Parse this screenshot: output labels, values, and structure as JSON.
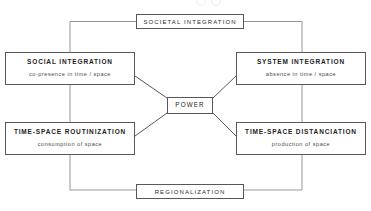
{
  "diagram": {
    "type": "concept-diagram",
    "nodes": {
      "societal_integration": {
        "title": "SOCIETAL INTEGRATION",
        "subtitle": ""
      },
      "regionalization": {
        "title": "REGIONALIZATION",
        "subtitle": ""
      },
      "social_integration": {
        "title": "SOCIAL INTEGRATION",
        "subtitle": "co-presence in time / space"
      },
      "system_integration": {
        "title": "SYSTEM INTEGRATION",
        "subtitle": "absence in time / space"
      },
      "time_space_routinization": {
        "title": "TIME-SPACE ROUTINIZATION",
        "subtitle": "consumption of space"
      },
      "time_space_distanciation": {
        "title": "TIME-SPACE DISTANCIATION",
        "subtitle": "production of space"
      },
      "power": {
        "title": "POWER",
        "subtitle": ""
      }
    },
    "connections": [
      {
        "from": "social_integration",
        "to": "power",
        "style": "diagonal"
      },
      {
        "from": "system_integration",
        "to": "power",
        "style": "diagonal"
      },
      {
        "from": "time_space_routinization",
        "to": "power",
        "style": "diagonal"
      },
      {
        "from": "time_space_distanciation",
        "to": "power",
        "style": "diagonal"
      },
      {
        "from": "societal_integration",
        "to": "social_integration",
        "style": "orthogonal-left"
      },
      {
        "from": "societal_integration",
        "to": "system_integration",
        "style": "orthogonal-right"
      },
      {
        "from": "regionalization",
        "to": "time_space_routinization",
        "style": "orthogonal-left"
      },
      {
        "from": "regionalization",
        "to": "time_space_distanciation",
        "style": "orthogonal-right"
      }
    ],
    "colors": {
      "background": "#ffffff",
      "line": "#58585a",
      "text": "#1d1d1d",
      "subtitle_text": "#4a4a4a"
    }
  }
}
